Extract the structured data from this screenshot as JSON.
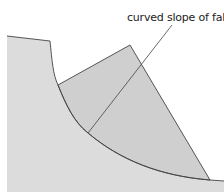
{
  "diagram": {
    "annotation": "curved slope of fall",
    "colors": {
      "ground": "#dcdcdc",
      "slump_block": "#cfcfcf",
      "outline": "#444444",
      "background": "#ffffff"
    }
  }
}
